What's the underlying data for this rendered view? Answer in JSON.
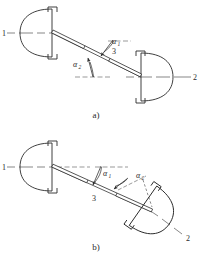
{
  "figure": {
    "title_implicit": "Universal joint driveshaft arrangements",
    "line_color": "#2a2a2a",
    "fill_color": "#ffffff",
    "centerline_color": "#555555"
  },
  "panels": [
    {
      "id": "a",
      "caption": "a)",
      "description": "Z-arrangement: input and output axes parallel, intermediate shaft inclined",
      "labels": {
        "shaft_input": "1",
        "shaft_output": "2",
        "shaft_intermediate": "3",
        "angle_first": "α",
        "angle_first_sub": "1",
        "angle_second": "α",
        "angle_second_sub": "2"
      }
    },
    {
      "id": "b",
      "caption": "b)",
      "description": "W-arrangement: output axis inclined, intermediate shaft inclined",
      "labels": {
        "shaft_input": "1",
        "shaft_output": "2",
        "shaft_intermediate": "3",
        "angle_first": "α",
        "angle_first_sub": "1",
        "angle_second": "α",
        "angle_second_sub": "2"
      }
    }
  ]
}
